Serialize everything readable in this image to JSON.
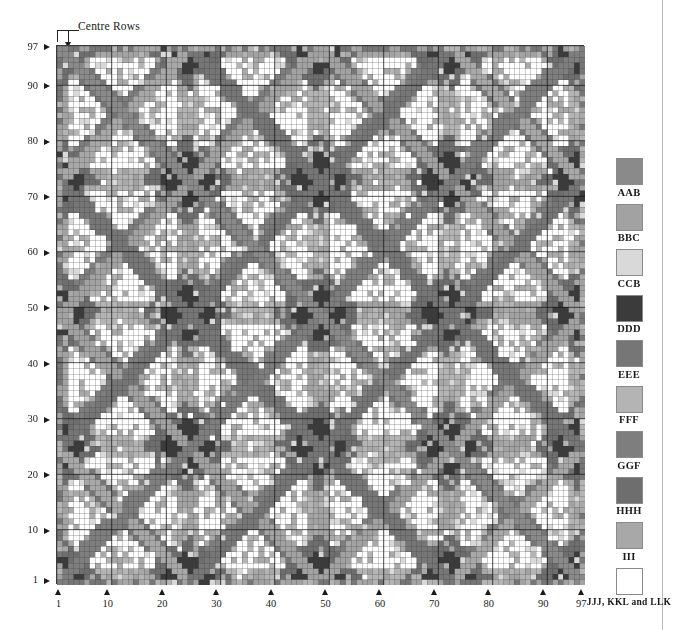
{
  "figure": {
    "annotation": "Centre Rows",
    "grid_size": 97,
    "axis": {
      "x_ticks": [
        1,
        10,
        20,
        30,
        40,
        50,
        60,
        70,
        80,
        90,
        97
      ],
      "y_ticks": [
        1,
        10,
        20,
        30,
        40,
        50,
        60,
        70,
        80,
        90,
        97
      ],
      "major_gridline_every": 10
    }
  },
  "legend": {
    "items": [
      {
        "label": "AAB",
        "color": "#8a8a8a"
      },
      {
        "label": "BBC",
        "color": "#a2a2a2"
      },
      {
        "label": "CCB",
        "color": "#d9d9d9"
      },
      {
        "label": "DDD",
        "color": "#3b3b3b"
      },
      {
        "label": "EEE",
        "color": "#767676"
      },
      {
        "label": "FFF",
        "color": "#b4b4b4"
      },
      {
        "label": "GGF",
        "color": "#7e7e7e"
      },
      {
        "label": "HHH",
        "color": "#6e6e6e"
      },
      {
        "label": "III",
        "color": "#a8a8a8"
      },
      {
        "label": "JJJ, KKL and LLK",
        "color": "#ffffff"
      }
    ]
  },
  "chart_data": {
    "type": "heatmap",
    "title": "",
    "xlabel": "",
    "ylabel": "",
    "grid": true,
    "legend_position": "right",
    "rows": 97,
    "cols": 97,
    "xlim": [
      1,
      97
    ],
    "ylim": [
      1,
      97
    ],
    "x_tick_labels": [
      "1",
      "10",
      "20",
      "30",
      "40",
      "50",
      "60",
      "70",
      "80",
      "90",
      "97"
    ],
    "y_tick_labels": [
      "1",
      "10",
      "20",
      "30",
      "40",
      "50",
      "60",
      "70",
      "80",
      "90",
      "97"
    ],
    "categories": [
      "AAB",
      "BBC",
      "CCB",
      "DDD",
      "EEE",
      "FFF",
      "GGF",
      "HHH",
      "III",
      "JJJ, KKL and LLK"
    ],
    "category_colors": [
      "#8a8a8a",
      "#a2a2a2",
      "#d9d9d9",
      "#3b3b3b",
      "#767676",
      "#b4b4b4",
      "#7e7e7e",
      "#6e6e6e",
      "#a8a8a8",
      "#ffffff"
    ],
    "annotations": [
      {
        "text": "Centre Rows",
        "target": "top-left corner of matrix, row 97 / column 1"
      }
    ]
  }
}
